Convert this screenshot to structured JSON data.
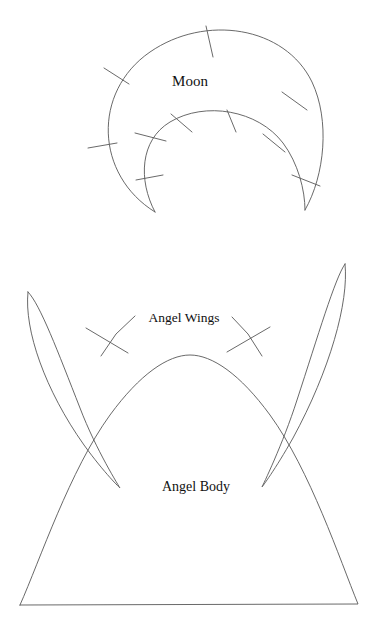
{
  "page": {
    "background_color": "#ffffff",
    "line_color": "#585858",
    "text_color": "#111111",
    "width": 375,
    "height": 632
  },
  "labels": {
    "moon": "Moon",
    "angel_wings": "Angel Wings",
    "angel_body": "Angel Body"
  },
  "shapes": {
    "moon": {
      "name": "Moon",
      "description": "crescent outline with notch tick marks",
      "outer_arc": "M 155 212 C 95 175 92 92 150 52 C 205 14 285 26 312 82 C 330 120 325 175 305 210",
      "inner_arc": "M 155 212 C 138 180 140 140 170 122 C 205 101 258 110 283 143 C 298 163 305 190 305 210",
      "notch_count": 10,
      "notches": [
        {
          "id": "moon-notch-1",
          "x1": 104,
          "y1": 68,
          "x2": 129,
          "y2": 84
        },
        {
          "id": "moon-notch-2",
          "x1": 88,
          "y1": 148,
          "x2": 117,
          "y2": 143
        },
        {
          "id": "moon-notch-3",
          "x1": 206,
          "y1": 26,
          "x2": 213,
          "y2": 57
        },
        {
          "id": "moon-notch-4",
          "x1": 282,
          "y1": 92,
          "x2": 307,
          "y2": 110
        },
        {
          "id": "moon-notch-5",
          "x1": 292,
          "y1": 175,
          "x2": 320,
          "y2": 186
        },
        {
          "id": "moon-notch-6",
          "x1": 171,
          "y1": 114,
          "x2": 192,
          "y2": 132
        },
        {
          "id": "moon-notch-7",
          "x1": 227,
          "y1": 110,
          "x2": 236,
          "y2": 132
        },
        {
          "id": "moon-notch-8",
          "x1": 135,
          "y1": 133,
          "x2": 166,
          "y2": 141
        },
        {
          "id": "moon-notch-9",
          "x1": 263,
          "y1": 134,
          "x2": 285,
          "y2": 152
        },
        {
          "id": "moon-notch-10",
          "x1": 136,
          "y1": 180,
          "x2": 163,
          "y2": 175
        }
      ]
    },
    "angel_wing_left": {
      "name": "Angel Wing Left",
      "path": "M 28 292 C 24 330 45 390 84 445 C 105 474 120 488 120 488 C 120 488 96 450 80 408 C 58 352 40 304 28 292 Z"
    },
    "angel_wing_right": {
      "name": "Angel Wing Right",
      "path": "M 345 264 C 349 302 330 370 293 438 C 275 470 262 487 262 487 C 262 487 283 444 297 400 C 318 336 335 278 345 264 Z"
    },
    "angel_body": {
      "name": "Angel Body",
      "path": "M 20 605 C 40 560 70 470 110 415 C 140 374 168 355 190 355 C 212 355 240 374 270 415 C 310 470 340 560 358 604 L 20 605 Z",
      "baseline": {
        "x1": 20,
        "y1": 605,
        "x2": 358,
        "y2": 604
      }
    }
  },
  "leaders": {
    "wing_left": {
      "line": "M 135 316 L 116 334 L 101 356",
      "tick": {
        "x1": 86,
        "y1": 328,
        "x2": 128,
        "y2": 353
      }
    },
    "wing_right": {
      "line": "M 232 317 L 248 334 L 262 356",
      "tick": {
        "x1": 227,
        "y1": 352,
        "x2": 270,
        "y2": 327
      }
    }
  },
  "label_positions": {
    "moon": {
      "x": 190,
      "y": 86
    },
    "angel_wings": {
      "x": 184,
      "y": 322
    },
    "angel_body": {
      "x": 196,
      "y": 491
    }
  }
}
